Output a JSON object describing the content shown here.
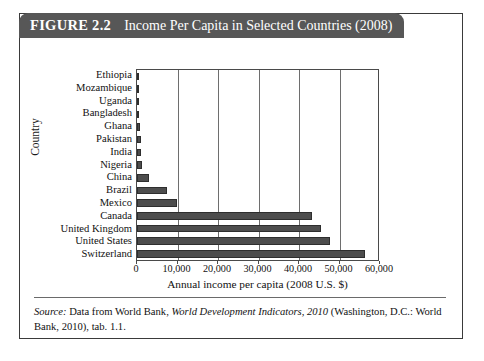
{
  "figure": {
    "number": "FIGURE 2.2",
    "title": "Income Per Capita in Selected Countries (2008)"
  },
  "source": {
    "label": "Source:",
    "text_before": " Data from World Bank, ",
    "italic_work": "World Development Indicators, 2010",
    "text_after": " (Washington, D.C.: World Bank, 2010), tab. 1.1."
  },
  "chart_data": {
    "type": "bar",
    "orientation": "horizontal",
    "title": "Income Per Capita in Selected Countries (2008)",
    "xlabel": "Annual income per capita (2008 U.S. $)",
    "ylabel": "Country",
    "xlim": [
      0,
      60000
    ],
    "xticks": [
      0,
      10000,
      20000,
      30000,
      40000,
      50000,
      60000
    ],
    "xticklabels": [
      "0",
      "10,000",
      "20,000",
      "30,000",
      "40,000",
      "50,000",
      "60,000"
    ],
    "grid": "vertical",
    "legend": "none",
    "bar_color": "#4d4d4d",
    "categories": [
      "Ethiopia",
      "Mozambique",
      "Uganda",
      "Bangladesh",
      "Ghana",
      "Pakistan",
      "India",
      "Nigeria",
      "China",
      "Brazil",
      "Mexico",
      "Canada",
      "United Kingdom",
      "United States",
      "Switzerland"
    ],
    "values": [
      280,
      370,
      420,
      520,
      670,
      980,
      1070,
      1160,
      2940,
      7350,
      9980,
      43270,
      45390,
      47580,
      56370
    ]
  }
}
